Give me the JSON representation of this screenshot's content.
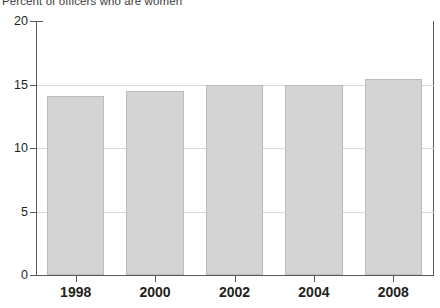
{
  "chart_data": {
    "type": "bar",
    "title": "Percent of officers who are women",
    "xlabel": "",
    "ylabel": "",
    "categories": [
      "1998",
      "2000",
      "2002",
      "2004",
      "2008"
    ],
    "values": [
      14.1,
      14.5,
      15.0,
      15.0,
      15.4
    ],
    "ylim": [
      0,
      20
    ],
    "yticks": [
      0,
      5,
      10,
      15,
      20
    ],
    "ytick_labels": [
      "0",
      "5",
      "10",
      "15",
      "20"
    ],
    "grid": true,
    "legend": false,
    "bar_color": "#d4d4d4",
    "bar_border_color": "#bcbcbc",
    "axis_color": "#58595b",
    "grid_color": "#d9d9d9",
    "text_color": "#231f20"
  }
}
